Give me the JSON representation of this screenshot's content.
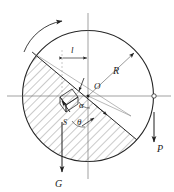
{
  "figure": {
    "background_color": "#ffffff",
    "line_color": "#262626",
    "hatch_color": "#555555",
    "width": 174,
    "height": 192
  },
  "labels": {
    "center": "O",
    "radius": "R",
    "offset_length": "l",
    "angle_alpha": "α",
    "angle_theta": "θ",
    "force_p": "P",
    "force_g": "G",
    "force_s": "S"
  },
  "elements": {
    "circle": {
      "name": "disc-outline",
      "cx": 88,
      "cy": 96,
      "r": 66
    },
    "center_point": {
      "cx": 88,
      "cy": 96
    },
    "right_pivot_point": {
      "cx": 154,
      "cy": 96
    },
    "chord": {
      "x1": 32,
      "y1": 52,
      "x2": 137,
      "y2": 140
    },
    "horizontal_axis": {
      "x1": 8,
      "y1": 96,
      "x2": 170,
      "y2": 96
    },
    "vertical_axis": {
      "x1": 88,
      "y1": 14,
      "x2": 88,
      "y2": 178
    },
    "dimension_l": {
      "x1": 62,
      "x2": 88,
      "y": 58
    },
    "radius_arrow": {
      "x1": 88,
      "y1": 96,
      "x2": 136,
      "y2": 52
    },
    "force_p_arrow": {
      "x": 154,
      "y1": 112,
      "y2": 140
    },
    "force_g_arrow": {
      "x": 62,
      "y1": 120,
      "y2": 172
    },
    "rotation_arrow": {
      "description": "counter-clockwise rotation arc at top-left"
    },
    "block": {
      "description": "small inclined block on the chord, lower-left of centre"
    }
  },
  "label_positions": {
    "center": {
      "x": 94,
      "y": 88
    },
    "radius": {
      "x": 116,
      "y": 72
    },
    "offset_length": {
      "x": 72,
      "y": 52
    },
    "angle_alpha": {
      "x": 80,
      "y": 106
    },
    "angle_theta": {
      "x": 78,
      "y": 124
    },
    "force_p": {
      "x": 158,
      "y": 150
    },
    "force_g": {
      "x": 57,
      "y": 186
    },
    "force_s": {
      "x": 63,
      "y": 126
    }
  }
}
